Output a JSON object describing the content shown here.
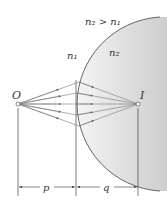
{
  "diagram": {
    "labels": {
      "condition": "n₂ > n₁",
      "medium1": "n₁",
      "medium2": "n₂",
      "object": "O",
      "image": "I",
      "object_distance": "p",
      "image_distance": "q"
    },
    "colors": {
      "medium2_fill_light": "#f2f2f2",
      "medium2_fill_dark": "#cfcfcf",
      "boundary": "#555555",
      "rays": "#777777",
      "arrows": "#666666",
      "lines": "#444444"
    },
    "points": {
      "object": {
        "x": 18,
        "y": 104
      },
      "image": {
        "x": 138,
        "y": 104
      }
    },
    "ray_count": 5
  }
}
